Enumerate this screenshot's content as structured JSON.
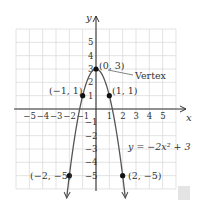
{
  "chart_data": {
    "type": "line",
    "title": "",
    "equation": "y = −2x² + 3",
    "xlabel": "x",
    "ylabel": "y",
    "xlim": [
      -6,
      6
    ],
    "ylim": [
      -6,
      6
    ],
    "grid": true,
    "x_ticks": [
      "−5",
      "−4",
      "−3",
      "−2",
      "−1",
      "1",
      "2",
      "3",
      "4",
      "5"
    ],
    "y_ticks": [
      "5",
      "4",
      "3",
      "2",
      "1",
      "−1",
      "−2",
      "−3",
      "−4",
      "−5"
    ],
    "series": [
      {
        "name": "y = −2x² + 3",
        "function": "-2*x^2+3",
        "x_range": [
          -2.2,
          2.2
        ]
      }
    ],
    "points": [
      {
        "x": 0,
        "y": 3,
        "label": "(0, 3)"
      },
      {
        "x": -1,
        "y": 1,
        "label": "(−1, 1)"
      },
      {
        "x": 1,
        "y": 1,
        "label": "(1, 1)"
      },
      {
        "x": -2,
        "y": -5,
        "label": "(−2, −5)"
      },
      {
        "x": 2,
        "y": -5,
        "label": "(2, −5)"
      }
    ],
    "annotations": [
      {
        "text": "Vertex",
        "points_to": [
          0,
          3
        ]
      }
    ]
  },
  "labels": {
    "x_axis": "x",
    "y_axis": "y",
    "vertex": "Vertex",
    "equation": "y = −2x² + 3",
    "p_vertex": "(0, 3)",
    "p_neg1": "(−1, 1)",
    "p_pos1": "(1, 1)",
    "p_neg2": "(−2, −5)",
    "p_pos2": "(2, −5)"
  },
  "colors": {
    "curve": "#555555",
    "grid": "#dcdcdc",
    "axis": "#333333",
    "point": "#111111"
  }
}
